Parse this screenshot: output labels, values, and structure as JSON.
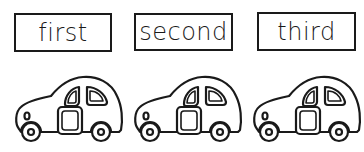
{
  "labels": [
    {
      "text": "first"
    },
    {
      "text": "second"
    },
    {
      "text": "third"
    }
  ],
  "cars": [
    {
      "icon": "car-icon"
    },
    {
      "icon": "car-icon"
    },
    {
      "icon": "car-icon"
    }
  ],
  "colors": {
    "ink": "#1a1a1a",
    "background": "#ffffff"
  }
}
